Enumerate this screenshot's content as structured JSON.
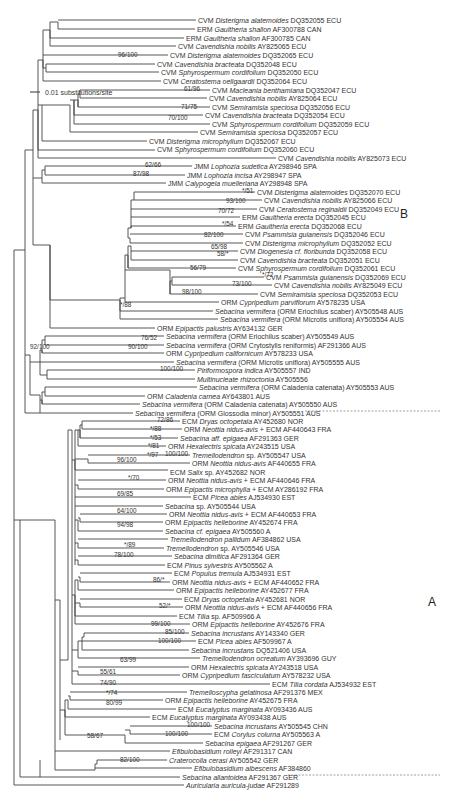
{
  "figure": {
    "scale_bar": {
      "label": "0.01 substitutions/site"
    },
    "clade_labels": [
      {
        "id": "B",
        "label": "B",
        "x": 400,
        "y": 213
      },
      {
        "id": "A",
        "label": "A",
        "x": 428,
        "y": 602
      }
    ],
    "taxa": [
      {
        "y": 20,
        "x": 196,
        "pre": "CVM ",
        "it": "Disterigma alatemoides",
        "post": " DQ352055 ECU"
      },
      {
        "y": 29,
        "x": 195,
        "pre": "ERM ",
        "it": "Gaultheria shallon",
        "post": " AF300788 CAN"
      },
      {
        "y": 38,
        "x": 184,
        "pre": "ERM ",
        "it": "Gaultheria shallon",
        "post": " AF300785 CAN"
      },
      {
        "y": 46,
        "x": 176,
        "pre": "CVM ",
        "it": "Cavendishia nobilis",
        "post": " AY825065 ECU"
      },
      {
        "y": 55,
        "x": 168,
        "pre": "CVM ",
        "it": "Disterigma alatemoides",
        "post": " DQ352065 ECU"
      },
      {
        "y": 64,
        "x": 155,
        "pre": "CVM ",
        "it": "Cavendishia bracteata",
        "post": " DQ352048 ECU"
      },
      {
        "y": 72,
        "x": 159,
        "pre": "CVM ",
        "it": "Sphyrospermum cordifolium",
        "post": " DQ352050 ECU"
      },
      {
        "y": 81,
        "x": 161,
        "pre": "CVM ",
        "it": "Ceratostema oellgaardii",
        "post": " DQ352064 ECU"
      },
      {
        "y": 90,
        "x": 210,
        "pre": "CVM ",
        "it": "Macleania benthamiana",
        "post": " DQ352047 ECU"
      },
      {
        "y": 98,
        "x": 207,
        "pre": "CVM ",
        "it": "Cavendishia nobilis",
        "post": " AY825064 ECU"
      },
      {
        "y": 107,
        "x": 210,
        "pre": "CVM ",
        "it": "Semiramisia speciosa",
        "post": " DQ352056 ECU"
      },
      {
        "y": 115,
        "x": 203,
        "pre": "CVM ",
        "it": "Cavendishia bracteata",
        "post": " DQ352054 ECU"
      },
      {
        "y": 124,
        "x": 210,
        "pre": "CVM ",
        "it": "Sphyrospermum cordifolium",
        "post": " DQ352059 ECU"
      },
      {
        "y": 132,
        "x": 198,
        "pre": "CVM ",
        "it": "Semiramisia speciosa",
        "post": " DQ352057 ECU"
      },
      {
        "y": 141,
        "x": 147,
        "pre": "CVM ",
        "it": "Disterigma microphyllum",
        "post": " DQ352067 ECU"
      },
      {
        "y": 149,
        "x": 155,
        "pre": "CVM ",
        "it": "Sphyrospermum cordifolium",
        "post": " DQ352060 ECU"
      },
      {
        "y": 158,
        "x": 276,
        "pre": "CVM ",
        "it": "Cavendishia nobilis",
        "post": " AY825073 ECU"
      },
      {
        "y": 166,
        "x": 192,
        "pre": "JMM ",
        "it": "Lophozia sudetica",
        "post": " AY298946 SPA"
      },
      {
        "y": 175,
        "x": 185,
        "pre": "JMM ",
        "it": "Lophozia incisa",
        "post": " AY298947 SPA"
      },
      {
        "y": 183,
        "x": 166,
        "pre": "JMM ",
        "it": "Calypogeia muelleriana",
        "post": " AY298948 SPA"
      },
      {
        "y": 192,
        "x": 255,
        "pre": "CVM ",
        "it": "Disterigma alatemoides",
        "post": " DQ352070 ECU"
      },
      {
        "y": 200,
        "x": 262,
        "pre": "CVM ",
        "it": "Cavendishia nobilis",
        "post": " AY825066 ECU"
      },
      {
        "y": 209,
        "x": 257,
        "pre": "CVM ",
        "it": "Ceratostema reginaldii",
        "post": " DQ352049 ECU"
      },
      {
        "y": 217,
        "x": 240,
        "pre": "ERM ",
        "it": "Gaultheria erecta",
        "post": " DQ352045 ECU"
      },
      {
        "y": 226,
        "x": 236,
        "pre": "ERM ",
        "it": "Gaultheria erecta",
        "post": " DQ352068 ECU"
      },
      {
        "y": 234,
        "x": 243,
        "pre": "CVM ",
        "it": "Psammisia guianensis",
        "post": " DQ352046 ECU"
      },
      {
        "y": 243,
        "x": 243,
        "pre": "CVM ",
        "it": "Disterigma microphyllum",
        "post": " DQ352052 ECU"
      },
      {
        "y": 251,
        "x": 238,
        "pre": "CVM ",
        "it": "Diogenesia cf. floribunda",
        "post": " DQ352058 ECU"
      },
      {
        "y": 260,
        "x": 238,
        "pre": "CVM ",
        "it": "Cavendishia bracteata",
        "post": " DQ352051 ECU"
      },
      {
        "y": 268,
        "x": 236,
        "pre": "CVM ",
        "it": "Sphyrospermum cordifolium",
        "post": " DQ352061 ECU"
      },
      {
        "y": 277,
        "x": 264,
        "pre": "CVM ",
        "it": "Psammisia guianensis",
        "post": " DQ352069 ECU"
      },
      {
        "y": 285,
        "x": 272,
        "pre": "CVM ",
        "it": "Cavendishia nobilis",
        "post": " AY825049 ECU"
      },
      {
        "y": 294,
        "x": 258,
        "pre": "CVM ",
        "it": "Semiramisia speciosa",
        "post": " DQ352053 ECU"
      },
      {
        "y": 302,
        "x": 219,
        "pre": "ORM ",
        "it": "Cypripedium parviflorum",
        "post": " AY578235 USA"
      },
      {
        "y": 311,
        "x": 213,
        "pre": "",
        "it": "Sebacina vermifera",
        "post": " (ORM Eriochilus scaber) AY505548 AUS"
      },
      {
        "y": 319,
        "x": 218,
        "pre": "",
        "it": "Sebacina vermifera",
        "post": " (ORM Microtis uniflora) AY505554 AUS"
      },
      {
        "y": 328,
        "x": 155,
        "pre": "ORM ",
        "it": "Epipactis palustris",
        "post": " AY634132 GER"
      },
      {
        "y": 336,
        "x": 164,
        "pre": "",
        "it": "Sebacina vermifera",
        "post": " (ORM Eriochilus scaber) AY505549 AUS"
      },
      {
        "y": 345,
        "x": 164,
        "pre": "",
        "it": "Sebacina vermifera",
        "post": " (ORM Crytostylis reniformis) AF291366 AUS"
      },
      {
        "y": 353,
        "x": 164,
        "pre": "ORM ",
        "it": "Cypripedium californicum",
        "post": " AY578233 USA"
      },
      {
        "y": 362,
        "x": 174,
        "pre": "",
        "it": "Sebacina vermifera",
        "post": " (ORM Microtis uniflora) AY505555 AUS"
      },
      {
        "y": 370,
        "x": 195,
        "pre": "",
        "it": "Piriformospora indica",
        "post": " AY505557 IND"
      },
      {
        "y": 379,
        "x": 195,
        "pre": "",
        "it": "Multinucleate rhizoctonia",
        "post": " AY505556"
      },
      {
        "y": 387,
        "x": 197,
        "pre": "",
        "it": "Sebacina vermifera",
        "post": " (ORM Caladenia catenata) AY505553 AUS"
      },
      {
        "y": 396,
        "x": 145,
        "pre": "ORM ",
        "it": "Caladenia carnea",
        "post": " AY643801 AUS"
      },
      {
        "y": 404,
        "x": 140,
        "pre": "",
        "it": "Sebacina vermifera",
        "post": " (ORM Caladenia catenata) AY505550 AUS"
      },
      {
        "y": 413,
        "x": 133,
        "pre": "",
        "it": "Sebacina vermifera",
        "post": " (ORM Glossodia minor) AY505551 AUS"
      },
      {
        "y": 421,
        "x": 180,
        "pre": "ECM ",
        "it": "Dryas octopetala",
        "post": " AY452680 NOR"
      },
      {
        "y": 429,
        "x": 182,
        "pre": "ORM ",
        "it": "Neottia nidus-avis",
        "post": " + ECM AF440643 FRA"
      },
      {
        "y": 438,
        "x": 178,
        "pre": "",
        "it": "Sebacina aff. epigaea",
        "post": " AF291363 GER"
      },
      {
        "y": 446,
        "x": 166,
        "pre": "ORM ",
        "it": "Hexalectris spicata",
        "post": " AY243515 USA"
      },
      {
        "y": 455,
        "x": 190,
        "pre": "",
        "it": "Tremellodendron",
        "post": " sp. AY505547 USA"
      },
      {
        "y": 463,
        "x": 190,
        "pre": "ORM ",
        "it": "Neottia nidus-avis",
        "post": " AF440655 FRA"
      },
      {
        "y": 472,
        "x": 168,
        "pre": "ECM ",
        "it": "Salix",
        "post": " sp. AY452682 NOR"
      },
      {
        "y": 480,
        "x": 166,
        "pre": "ORM ",
        "it": "Neottia nidus-avis",
        "post": " + ECM AF440646 FRA"
      },
      {
        "y": 489,
        "x": 164,
        "pre": "ORM ",
        "it": "Epipactis microphylla",
        "post": " + ECM AY286192 FRA"
      },
      {
        "y": 497,
        "x": 191,
        "pre": "ECM ",
        "it": "Picea abies",
        "post": " AJ534930 EST"
      },
      {
        "y": 506,
        "x": 163,
        "pre": "",
        "it": "Sebacina",
        "post": " sp. AY505544 USA"
      },
      {
        "y": 514,
        "x": 167,
        "pre": "ORM ",
        "it": "Neottia nidus-avis",
        "post": " + ECM AF440653 FRA"
      },
      {
        "y": 522,
        "x": 163,
        "pre": "ORM ",
        "it": "Epipactis helleborine",
        "post": " AY452674 FRA"
      },
      {
        "y": 531,
        "x": 163,
        "pre": "",
        "it": "Sebacina cf. epigaea",
        "post": " AY505560 A"
      },
      {
        "y": 539,
        "x": 168,
        "pre": "",
        "it": "Tremellodendron pallidum",
        "post": " AF384862 USA"
      },
      {
        "y": 548,
        "x": 164,
        "pre": "",
        "it": "Tremellodendron",
        "post": " sp. AY505546 USA"
      },
      {
        "y": 556,
        "x": 172,
        "pre": "",
        "it": "Sebacina dimitica",
        "post": " AF291364 GER"
      },
      {
        "y": 565,
        "x": 165,
        "pre": "ECM ",
        "it": "Pinus sylvestris",
        "post": " AY505562 A"
      },
      {
        "y": 573,
        "x": 172,
        "pre": "ECM ",
        "it": "Populus tremula",
        "post": " AJ534931 EST"
      },
      {
        "y": 582,
        "x": 170,
        "pre": "ORM ",
        "it": "Neottia nidus-avis",
        "post": " + ECM AF440652 FRA"
      },
      {
        "y": 590,
        "x": 174,
        "pre": "ORM ",
        "it": "Epipactis helleborine",
        "post": " AY452677 FRA"
      },
      {
        "y": 599,
        "x": 182,
        "pre": "ECM ",
        "it": "Dryas octopetala",
        "post": " AY452681 NOR"
      },
      {
        "y": 607,
        "x": 183,
        "pre": "ORM ",
        "it": "Neottia nidus-avis",
        "post": " + ECM AF440656 FRA"
      },
      {
        "y": 616,
        "x": 177,
        "pre": "ECM ",
        "it": "Tilia",
        "post": " sp. AF509966 A"
      },
      {
        "y": 624,
        "x": 190,
        "pre": "ORM ",
        "it": "Epipactis helleborine",
        "post": " AY452676 FRA"
      },
      {
        "y": 633,
        "x": 189,
        "pre": "",
        "it": "Sebacina incrustans",
        "post": " AY143340 GER"
      },
      {
        "y": 641,
        "x": 196,
        "pre": "ECM ",
        "it": "Picea abies",
        "post": " AF509967 A"
      },
      {
        "y": 650,
        "x": 189,
        "pre": "",
        "it": "Sebacina incrustans",
        "post": " DQ521406 USA"
      },
      {
        "y": 658,
        "x": 200,
        "pre": "",
        "it": "Tremellodendron ocreatum",
        "post": " AY393696 GUY"
      },
      {
        "y": 667,
        "x": 189,
        "pre": "ORM ",
        "it": "Hexalectris spicata",
        "post": " AY243518 USA"
      },
      {
        "y": 675,
        "x": 180,
        "pre": "ORM ",
        "it": "Cypripedium fasciculatum",
        "post": " AY578232 USA"
      },
      {
        "y": 684,
        "x": 270,
        "pre": "ECM ",
        "it": "Tilia cordata",
        "post": " AJ534932 EST"
      },
      {
        "y": 692,
        "x": 187,
        "pre": "",
        "it": "Tremelloscypha gelatinosa",
        "post": " AF291376 MEX"
      },
      {
        "y": 700,
        "x": 163,
        "pre": "ORM ",
        "it": "Epipactis helleborine",
        "post": " AY452675 FRA"
      },
      {
        "y": 709,
        "x": 176,
        "pre": "ECM ",
        "it": "Eucalyptus marginata",
        "post": " AY093436 AUS"
      },
      {
        "y": 717,
        "x": 150,
        "pre": "ECM ",
        "it": "Eucalyptus marginata",
        "post": " AY093438 AUS"
      },
      {
        "y": 726,
        "x": 212,
        "pre": "",
        "it": "Sebacina incrustans",
        "post": " AY505545 CHN"
      },
      {
        "y": 734,
        "x": 212,
        "pre": "ECM ",
        "it": "Corylus colurna",
        "post": " AY505563 A"
      },
      {
        "y": 743,
        "x": 203,
        "pre": "",
        "it": "Sebacina epigaea",
        "post": " AF291267 GER"
      },
      {
        "y": 751,
        "x": 170,
        "pre": "",
        "it": "Efibulobasidium rolleyi",
        "post": " AF291317 CAN"
      },
      {
        "y": 760,
        "x": 167,
        "pre": "",
        "it": "Craterocolla cerasi",
        "post": " AY505542 GER"
      },
      {
        "y": 768,
        "x": 192,
        "pre": "",
        "it": "Efibulobasidium albescens",
        "post": " AF384860"
      },
      {
        "y": 777,
        "x": 180,
        "pre": "",
        "it": "Sebacina allantoidea",
        "post": " AF291367 GER"
      },
      {
        "y": 785,
        "x": 184,
        "pre": "",
        "it": "Auricularia auricula-judae",
        "post": " AF291289"
      }
    ],
    "support_values": [
      {
        "label": "96/100",
        "x": 118,
        "y": 57
      },
      {
        "label": "61/96",
        "x": 184,
        "y": 91
      },
      {
        "label": "71/75",
        "x": 181,
        "y": 109
      },
      {
        "label": "70/100",
        "x": 168,
        "y": 120
      },
      {
        "label": "62/66",
        "x": 145,
        "y": 167
      },
      {
        "label": "87/98",
        "x": 133,
        "y": 176
      },
      {
        "label": "*/51",
        "x": 242,
        "y": 193
      },
      {
        "label": "93/100",
        "x": 226,
        "y": 203
      },
      {
        "label": "70/72",
        "x": 218,
        "y": 213
      },
      {
        "label": "*/54",
        "x": 222,
        "y": 226
      },
      {
        "label": "82/100",
        "x": 204,
        "y": 237
      },
      {
        "label": "65/98",
        "x": 211,
        "y": 249
      },
      {
        "label": "58/*",
        "x": 217,
        "y": 256
      },
      {
        "label": "56/79",
        "x": 190,
        "y": 270
      },
      {
        "label": "*/72",
        "x": 262,
        "y": 277
      },
      {
        "label": "73/100",
        "x": 232,
        "y": 286
      },
      {
        "label": "98/100",
        "x": 182,
        "y": 294
      },
      {
        "label": "*/88",
        "x": 120,
        "y": 307
      },
      {
        "label": "76/52",
        "x": 141,
        "y": 340
      },
      {
        "label": "90/100",
        "x": 128,
        "y": 349
      },
      {
        "label": "92/100",
        "x": 30,
        "y": 349
      },
      {
        "label": "100/100",
        "x": 160,
        "y": 371
      },
      {
        "label": "72/86",
        "x": 157,
        "y": 422
      },
      {
        "label": "*/88",
        "x": 150,
        "y": 431
      },
      {
        "label": "*/53",
        "x": 150,
        "y": 440
      },
      {
        "label": "*/81",
        "x": 148,
        "y": 448
      },
      {
        "label": "*/97",
        "x": 147,
        "y": 457
      },
      {
        "label": "100/100",
        "x": 165,
        "y": 456
      },
      {
        "label": "96/100",
        "x": 117,
        "y": 462
      },
      {
        "label": "*/70",
        "x": 128,
        "y": 480
      },
      {
        "label": "69/85",
        "x": 117,
        "y": 496
      },
      {
        "label": "64/100",
        "x": 117,
        "y": 513
      },
      {
        "label": "94/98",
        "x": 117,
        "y": 527
      },
      {
        "label": "*/89",
        "x": 124,
        "y": 547
      },
      {
        "label": "78/100",
        "x": 114,
        "y": 557
      },
      {
        "label": "86/*",
        "x": 153,
        "y": 582
      },
      {
        "label": "52/*",
        "x": 159,
        "y": 608
      },
      {
        "label": "99/100",
        "x": 151,
        "y": 626
      },
      {
        "label": "85/100",
        "x": 165,
        "y": 634
      },
      {
        "label": "100/100",
        "x": 158,
        "y": 643
      },
      {
        "label": "63/99",
        "x": 120,
        "y": 662
      },
      {
        "label": "55/61",
        "x": 100,
        "y": 674
      },
      {
        "label": "74/90",
        "x": 100,
        "y": 685
      },
      {
        "label": "*/74",
        "x": 106,
        "y": 695
      },
      {
        "label": "80/99",
        "x": 106,
        "y": 705
      },
      {
        "label": "100/100",
        "x": 187,
        "y": 727
      },
      {
        "label": "100/100",
        "x": 165,
        "y": 736
      },
      {
        "label": "58/67",
        "x": 87,
        "y": 738
      },
      {
        "label": "82/100",
        "x": 120,
        "y": 762
      }
    ]
  }
}
